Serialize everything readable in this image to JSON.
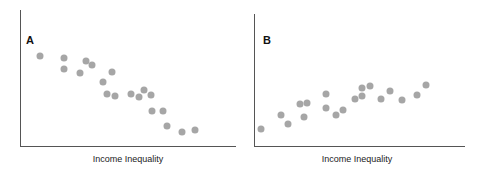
{
  "chart_data": [
    {
      "type": "scatter",
      "title": "A",
      "xlabel": "Income Inequality",
      "ylabel": "",
      "grid": false,
      "trend": "negative",
      "points_px": [
        [
          40,
          56
        ],
        [
          64,
          58
        ],
        [
          64,
          69
        ],
        [
          80,
          73
        ],
        [
          86,
          61
        ],
        [
          92,
          65
        ],
        [
          103,
          82
        ],
        [
          112,
          72
        ],
        [
          107,
          94
        ],
        [
          115,
          96
        ],
        [
          131,
          94
        ],
        [
          139,
          97
        ],
        [
          144,
          90
        ],
        [
          151,
          95
        ],
        [
          152,
          111
        ],
        [
          163,
          111
        ],
        [
          167,
          126
        ],
        [
          182,
          132
        ],
        [
          195,
          130
        ]
      ],
      "points": [
        [
          0.09,
          0.66
        ],
        [
          0.2,
          0.65
        ],
        [
          0.2,
          0.57
        ],
        [
          0.28,
          0.54
        ],
        [
          0.3,
          0.63
        ],
        [
          0.33,
          0.6
        ],
        [
          0.38,
          0.47
        ],
        [
          0.43,
          0.54
        ],
        [
          0.4,
          0.38
        ],
        [
          0.44,
          0.37
        ],
        [
          0.51,
          0.38
        ],
        [
          0.55,
          0.36
        ],
        [
          0.57,
          0.41
        ],
        [
          0.61,
          0.38
        ],
        [
          0.61,
          0.26
        ],
        [
          0.66,
          0.26
        ],
        [
          0.68,
          0.15
        ],
        [
          0.75,
          0.1
        ],
        [
          0.81,
          0.12
        ]
      ]
    },
    {
      "type": "scatter",
      "title": "B",
      "xlabel": "Income Inequality",
      "ylabel": "",
      "grid": false,
      "trend": "positive",
      "points_px": [
        [
          261,
          129
        ],
        [
          281,
          115
        ],
        [
          288,
          124
        ],
        [
          300,
          104
        ],
        [
          304,
          117
        ],
        [
          307,
          103
        ],
        [
          326,
          94
        ],
        [
          326,
          108
        ],
        [
          336,
          115
        ],
        [
          343,
          110
        ],
        [
          355,
          99
        ],
        [
          362,
          88
        ],
        [
          362,
          96
        ],
        [
          370,
          86
        ],
        [
          381,
          99
        ],
        [
          390,
          91
        ],
        [
          402,
          100
        ],
        [
          417,
          95
        ],
        [
          426,
          85
        ]
      ],
      "points": [
        [
          0.03,
          0.13
        ],
        [
          0.13,
          0.23
        ],
        [
          0.16,
          0.16
        ],
        [
          0.22,
          0.31
        ],
        [
          0.24,
          0.21
        ],
        [
          0.25,
          0.32
        ],
        [
          0.34,
          0.38
        ],
        [
          0.34,
          0.28
        ],
        [
          0.39,
          0.23
        ],
        [
          0.42,
          0.26
        ],
        [
          0.48,
          0.35
        ],
        [
          0.51,
          0.43
        ],
        [
          0.51,
          0.37
        ],
        [
          0.55,
          0.44
        ],
        [
          0.6,
          0.35
        ],
        [
          0.64,
          0.4
        ],
        [
          0.7,
          0.34
        ],
        [
          0.77,
          0.37
        ],
        [
          0.81,
          0.45
        ]
      ]
    }
  ],
  "panels": {
    "a": {
      "label": "A",
      "xlabel": "Income Inequality"
    },
    "b": {
      "label": "B",
      "xlabel": "Income Inequality"
    }
  },
  "colors": {
    "dot": "#a6a6a6",
    "axis": "#555555"
  }
}
